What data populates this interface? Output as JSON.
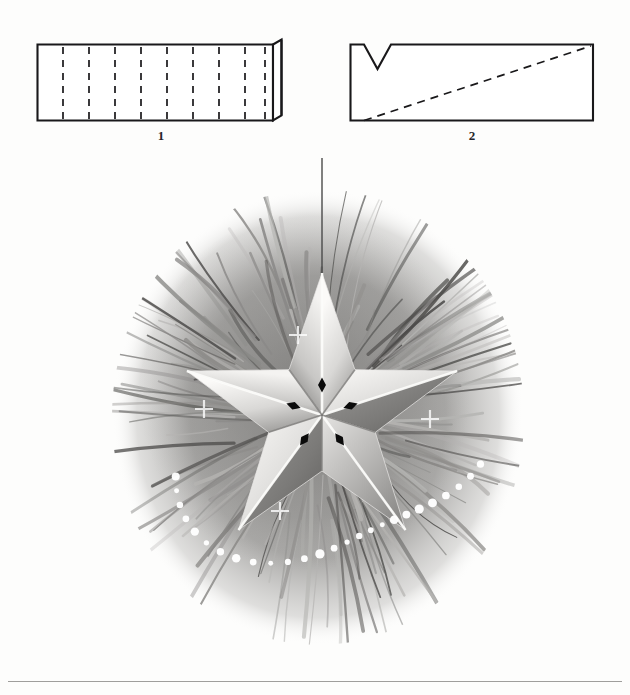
{
  "page": {
    "background_color": "#fdfdfc",
    "width": 630,
    "height": 695,
    "footer_rule_color": "#8e8d8b"
  },
  "diagrams": [
    {
      "label": "1",
      "name": "folded-strip-diagram",
      "description": "Rectangular paper strip with nine vertical dashed fold lines and a folded flap on the right edge",
      "stroke_color": "#1a1a1a",
      "dash_count": 9,
      "has_right_flap": true,
      "x": 37,
      "y": 44,
      "width": 238,
      "height": 76
    },
    {
      "label": "2",
      "name": "notched-strip-diagram",
      "description": "Rectangle with a V notch cut into the top left area and a dashed diagonal from bottom-left to top-right",
      "stroke_color": "#1a1a1a",
      "has_v_notch": true,
      "has_diagonal_dashed_line": true,
      "x": 352,
      "y": 44,
      "width": 240,
      "height": 76
    }
  ],
  "illustration": {
    "name": "star-ornament-illustration",
    "title": "Faceted paper star ornament hanging among pine branches",
    "medium": "grayscale pencil and wash drawing",
    "star": {
      "points": 5,
      "orientation": "one point up",
      "center_x": 322,
      "center_y": 415,
      "outer_radius": 142,
      "inner_radius": 56,
      "center_diamonds": 5,
      "diamond_color": "#0b0b0b",
      "highlight_color": "#fdfdfb",
      "midtone_color": "#b9b8b6",
      "shadow_color": "#6d6c6a",
      "sparkle_count": 4
    },
    "foliage": {
      "name": "pine-boughs",
      "center_x": 318,
      "center_y": 415,
      "radius_x": 205,
      "radius_y": 230,
      "needle_count": 168,
      "tone_light": "#b5b4b2",
      "tone_mid": "#8a8987",
      "tone_dark": "#4c4b49"
    },
    "garland": {
      "name": "bead-garland",
      "bead_count": 26,
      "bead_color": "#ffffff"
    },
    "hanging_thread": {
      "name": "hanging-thread",
      "color": "#4a4a4a",
      "x": 322,
      "top_y": 158,
      "bottom_y": 300
    }
  },
  "chart_data": {
    "type": "table",
    "categories": [
      "1",
      "2"
    ],
    "values": [
      1,
      2
    ]
  }
}
